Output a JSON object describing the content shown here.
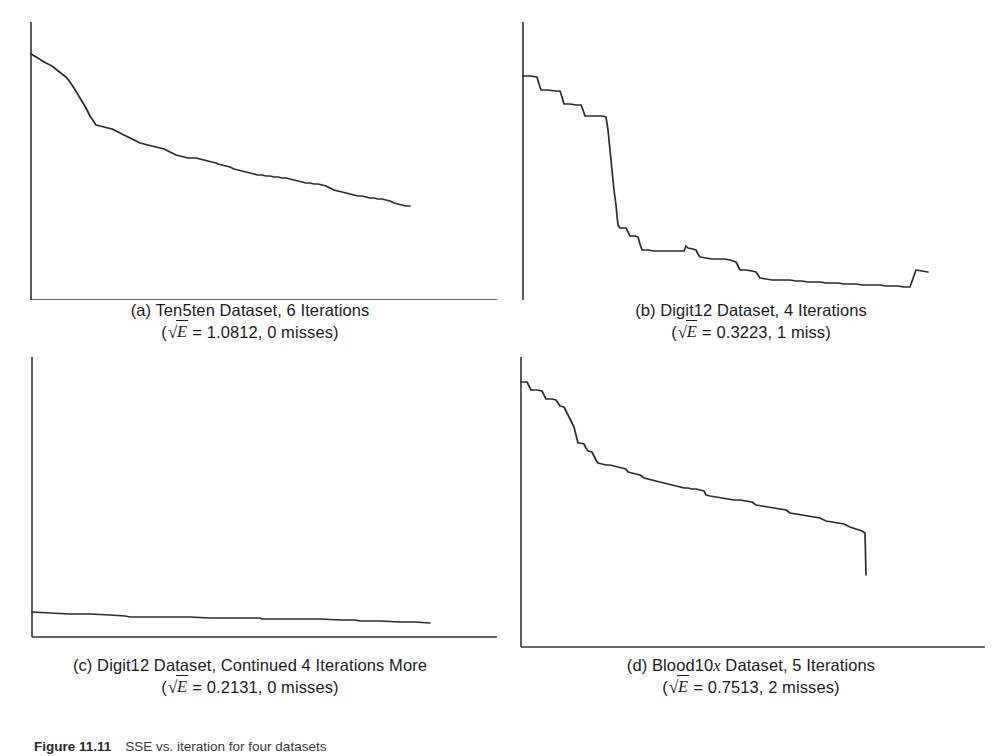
{
  "figure": {
    "label": "Figure 11.11",
    "caption_text": "SSE vs. iteration for four datasets",
    "panels": [
      {
        "id": "a",
        "position": "top-left",
        "caption_line_1": "(a) Ten5ten Dataset, 6 Iterations",
        "marker": "(a)",
        "dataset": "Ten5ten Dataset",
        "iterations_text": "6 Iterations",
        "metric_symbol": "E",
        "metric_value": "1.0812",
        "misses_text": "0 misses",
        "caption_line_2_prefix": "(",
        "caption_line_2_middle": " = 1.0812, 0 misses)"
      },
      {
        "id": "b",
        "position": "top-right",
        "caption_line_1": "(b) Digit12 Dataset, 4 Iterations",
        "marker": "(b)",
        "dataset": "Digit12 Dataset",
        "iterations_text": "4 Iterations",
        "metric_symbol": "E",
        "metric_value": "0.3223",
        "misses_text": "1 miss",
        "caption_line_2_prefix": "(",
        "caption_line_2_middle": " = 0.3223, 1 miss)"
      },
      {
        "id": "c",
        "position": "bottom-left",
        "caption_line_1": "(c) Digit12 Dataset, Continued 4 Iterations More",
        "marker": "(c)",
        "dataset": "Digit12 Dataset",
        "iterations_text": "Continued 4 Iterations More",
        "metric_symbol": "E",
        "metric_value": "0.2131",
        "misses_text": "0 misses",
        "caption_line_2_prefix": "(",
        "caption_line_2_middle": " = 0.2131, 0 misses)"
      },
      {
        "id": "d",
        "position": "bottom-right",
        "caption_line_1_pre": "(d) Blood10",
        "caption_line_1_italic": "x",
        "caption_line_1_post": " Dataset, 5 Iterations",
        "marker": "(d)",
        "dataset": "Blood10x Dataset",
        "iterations_text": "5 Iterations",
        "metric_symbol": "E",
        "metric_value": "0.7513",
        "misses_text": "2 misses",
        "caption_line_2_prefix": "(",
        "caption_line_2_middle": " = 0.7513, 2 misses)"
      }
    ]
  },
  "style": {
    "line_color": "#2b2b2b",
    "axis_color": "#333333",
    "background": "#ffffff",
    "text_color": "#1b1b1b"
  },
  "chart_data": [
    {
      "type": "line",
      "panel": "a",
      "title": "(a) Ten5ten Dataset, 6 Iterations",
      "xlabel": "",
      "ylabel": "",
      "grid": false,
      "legend": "none",
      "axis_box": {
        "x0": 31,
        "y0": 300,
        "x1": 497,
        "y1": 22
      },
      "xlim": [
        0,
        1
      ],
      "ylim": [
        0,
        1
      ],
      "sqrt_E": 1.0812,
      "misses": 0,
      "points": [
        [
          31,
          54
        ],
        [
          36,
          57
        ],
        [
          41,
          60
        ],
        [
          46,
          63
        ],
        [
          52,
          66
        ],
        [
          57,
          70
        ],
        [
          62,
          74
        ],
        [
          66,
          77
        ],
        [
          70,
          82
        ],
        [
          74,
          88
        ],
        [
          77,
          93
        ],
        [
          80,
          98
        ],
        [
          83,
          103
        ],
        [
          86,
          108
        ],
        [
          88,
          112
        ],
        [
          90,
          116
        ],
        [
          92,
          119
        ],
        [
          94,
          122
        ],
        [
          96,
          125
        ],
        [
          100,
          126
        ],
        [
          104,
          127
        ],
        [
          108,
          128
        ],
        [
          112,
          129
        ],
        [
          116,
          131
        ],
        [
          120,
          133
        ],
        [
          124,
          135
        ],
        [
          128,
          137
        ],
        [
          132,
          139
        ],
        [
          136,
          141
        ],
        [
          140,
          143
        ],
        [
          144,
          144
        ],
        [
          148,
          145
        ],
        [
          152,
          146
        ],
        [
          156,
          147
        ],
        [
          160,
          148
        ],
        [
          164,
          149
        ],
        [
          168,
          151
        ],
        [
          172,
          153
        ],
        [
          176,
          155
        ],
        [
          180,
          156
        ],
        [
          184,
          157
        ],
        [
          188,
          158
        ],
        [
          192,
          158
        ],
        [
          196,
          158
        ],
        [
          200,
          159
        ],
        [
          204,
          160
        ],
        [
          208,
          161
        ],
        [
          212,
          162
        ],
        [
          216,
          163
        ],
        [
          218,
          164
        ],
        [
          222,
          165
        ],
        [
          226,
          166
        ],
        [
          230,
          167
        ],
        [
          234,
          169
        ],
        [
          238,
          170
        ],
        [
          242,
          171
        ],
        [
          246,
          172
        ],
        [
          250,
          173
        ],
        [
          254,
          174
        ],
        [
          258,
          175
        ],
        [
          262,
          175
        ],
        [
          266,
          176
        ],
        [
          270,
          176
        ],
        [
          274,
          177
        ],
        [
          278,
          177
        ],
        [
          282,
          178
        ],
        [
          286,
          178
        ],
        [
          290,
          179
        ],
        [
          294,
          180
        ],
        [
          298,
          181
        ],
        [
          302,
          182
        ],
        [
          306,
          183
        ],
        [
          310,
          183
        ],
        [
          314,
          184
        ],
        [
          318,
          184
        ],
        [
          322,
          185
        ],
        [
          326,
          186
        ],
        [
          330,
          188
        ],
        [
          334,
          190
        ],
        [
          338,
          191
        ],
        [
          342,
          192
        ],
        [
          346,
          193
        ],
        [
          350,
          194
        ],
        [
          354,
          195
        ],
        [
          358,
          196
        ],
        [
          362,
          196
        ],
        [
          366,
          197
        ],
        [
          370,
          198
        ],
        [
          374,
          198
        ],
        [
          378,
          199
        ],
        [
          382,
          199
        ],
        [
          386,
          200
        ],
        [
          390,
          201
        ],
        [
          394,
          203
        ],
        [
          398,
          204
        ],
        [
          402,
          205
        ],
        [
          406,
          206
        ],
        [
          410,
          206
        ]
      ]
    },
    {
      "type": "line",
      "panel": "b",
      "title": "(b) Digit12 Dataset, 4 Iterations",
      "xlabel": "",
      "ylabel": "",
      "grid": false,
      "legend": "none",
      "axis_box": {
        "x0": 523,
        "y0": 305,
        "x1": 995,
        "y1": 22
      },
      "xlim": [
        0,
        1
      ],
      "ylim": [
        0,
        1
      ],
      "sqrt_E": 0.3223,
      "misses": 1,
      "points": [
        [
          523,
          76
        ],
        [
          530,
          76
        ],
        [
          537,
          77
        ],
        [
          539,
          84
        ],
        [
          541,
          90
        ],
        [
          548,
          90
        ],
        [
          555,
          91
        ],
        [
          560,
          91
        ],
        [
          562,
          97
        ],
        [
          564,
          104
        ],
        [
          570,
          104
        ],
        [
          576,
          105
        ],
        [
          581,
          105
        ],
        [
          583,
          110
        ],
        [
          585,
          116
        ],
        [
          590,
          116
        ],
        [
          596,
          116
        ],
        [
          602,
          116
        ],
        [
          606,
          117
        ],
        [
          608,
          130
        ],
        [
          610,
          150
        ],
        [
          612,
          170
        ],
        [
          614,
          190
        ],
        [
          616,
          205
        ],
        [
          617,
          216
        ],
        [
          618,
          225
        ],
        [
          620,
          228
        ],
        [
          626,
          228
        ],
        [
          628,
          232
        ],
        [
          630,
          236
        ],
        [
          635,
          236
        ],
        [
          638,
          237
        ],
        [
          640,
          244
        ],
        [
          642,
          250
        ],
        [
          648,
          250
        ],
        [
          654,
          251
        ],
        [
          660,
          251
        ],
        [
          666,
          251
        ],
        [
          672,
          251
        ],
        [
          678,
          251
        ],
        [
          684,
          251
        ],
        [
          686,
          246
        ],
        [
          688,
          248
        ],
        [
          693,
          249
        ],
        [
          696,
          250
        ],
        [
          698,
          254
        ],
        [
          700,
          257
        ],
        [
          706,
          258
        ],
        [
          712,
          259
        ],
        [
          718,
          259
        ],
        [
          724,
          259
        ],
        [
          730,
          260
        ],
        [
          736,
          262
        ],
        [
          738,
          266
        ],
        [
          740,
          270
        ],
        [
          746,
          270
        ],
        [
          752,
          271
        ],
        [
          756,
          272
        ],
        [
          758,
          275
        ],
        [
          760,
          278
        ],
        [
          766,
          279
        ],
        [
          772,
          280
        ],
        [
          778,
          280
        ],
        [
          784,
          280
        ],
        [
          790,
          280
        ],
        [
          796,
          281
        ],
        [
          802,
          281
        ],
        [
          808,
          282
        ],
        [
          814,
          282
        ],
        [
          820,
          282
        ],
        [
          826,
          283
        ],
        [
          832,
          283
        ],
        [
          838,
          283
        ],
        [
          844,
          284
        ],
        [
          850,
          284
        ],
        [
          856,
          284
        ],
        [
          862,
          285
        ],
        [
          868,
          285
        ],
        [
          874,
          285
        ],
        [
          880,
          285
        ],
        [
          886,
          286
        ],
        [
          892,
          286
        ],
        [
          898,
          286
        ],
        [
          904,
          287
        ],
        [
          910,
          287
        ],
        [
          916,
          270
        ],
        [
          922,
          271
        ],
        [
          928,
          272
        ]
      ]
    },
    {
      "type": "line",
      "panel": "c",
      "title": "(c) Digit12 Dataset, Continued 4 Iterations More",
      "xlabel": "",
      "ylabel": "",
      "grid": false,
      "legend": "none",
      "axis_box": {
        "x0": 32,
        "y0": 662,
        "x1": 497,
        "y1": 382
      },
      "xlim": [
        0,
        1
      ],
      "ylim": [
        0,
        1
      ],
      "sqrt_E": 0.2131,
      "misses": 0,
      "points": [
        [
          32,
          637
        ],
        [
          50,
          638
        ],
        [
          70,
          639
        ],
        [
          90,
          639
        ],
        [
          110,
          640
        ],
        [
          125,
          641
        ],
        [
          130,
          642
        ],
        [
          150,
          642
        ],
        [
          170,
          642
        ],
        [
          190,
          642
        ],
        [
          210,
          643
        ],
        [
          230,
          643
        ],
        [
          250,
          643
        ],
        [
          260,
          643
        ],
        [
          262,
          644
        ],
        [
          280,
          644
        ],
        [
          300,
          644
        ],
        [
          320,
          644
        ],
        [
          340,
          645
        ],
        [
          355,
          645
        ],
        [
          360,
          646
        ],
        [
          380,
          646
        ],
        [
          400,
          647
        ],
        [
          415,
          647
        ],
        [
          430,
          648
        ]
      ]
    },
    {
      "type": "line",
      "panel": "d",
      "title": "(d) Blood10x Dataset, 5 Iterations",
      "xlabel": "",
      "ylabel": "",
      "grid": false,
      "legend": "none",
      "axis_box": {
        "x0": 521,
        "y0": 672,
        "x1": 995,
        "y1": 382
      },
      "xlim": [
        0,
        1
      ],
      "ylim": [
        0,
        1
      ],
      "sqrt_E": 0.7513,
      "misses": 2,
      "points": [
        [
          521,
          407
        ],
        [
          527,
          407
        ],
        [
          529,
          411
        ],
        [
          531,
          415
        ],
        [
          537,
          415
        ],
        [
          542,
          416
        ],
        [
          544,
          420
        ],
        [
          546,
          424
        ],
        [
          552,
          424
        ],
        [
          556,
          425
        ],
        [
          558,
          428
        ],
        [
          560,
          431
        ],
        [
          564,
          432
        ],
        [
          566,
          436
        ],
        [
          568,
          440
        ],
        [
          570,
          444
        ],
        [
          572,
          448
        ],
        [
          574,
          452
        ],
        [
          575,
          456
        ],
        [
          576,
          460
        ],
        [
          577,
          464
        ],
        [
          578,
          468
        ],
        [
          580,
          468
        ],
        [
          584,
          469
        ],
        [
          586,
          473
        ],
        [
          588,
          476
        ],
        [
          592,
          477
        ],
        [
          594,
          481
        ],
        [
          596,
          485
        ],
        [
          598,
          488
        ],
        [
          602,
          489
        ],
        [
          606,
          490
        ],
        [
          610,
          490
        ],
        [
          614,
          491
        ],
        [
          618,
          492
        ],
        [
          622,
          493
        ],
        [
          626,
          494
        ],
        [
          628,
          497
        ],
        [
          632,
          498
        ],
        [
          636,
          499
        ],
        [
          640,
          500
        ],
        [
          644,
          503
        ],
        [
          648,
          504
        ],
        [
          652,
          505
        ],
        [
          656,
          506
        ],
        [
          660,
          507
        ],
        [
          664,
          508
        ],
        [
          668,
          509
        ],
        [
          672,
          510
        ],
        [
          676,
          511
        ],
        [
          680,
          512
        ],
        [
          684,
          513
        ],
        [
          688,
          513
        ],
        [
          692,
          514
        ],
        [
          696,
          514
        ],
        [
          700,
          515
        ],
        [
          704,
          516
        ],
        [
          706,
          520
        ],
        [
          710,
          521
        ],
        [
          716,
          522
        ],
        [
          722,
          523
        ],
        [
          728,
          524
        ],
        [
          734,
          525
        ],
        [
          740,
          525
        ],
        [
          746,
          526
        ],
        [
          752,
          527
        ],
        [
          756,
          530
        ],
        [
          762,
          531
        ],
        [
          768,
          532
        ],
        [
          774,
          533
        ],
        [
          780,
          534
        ],
        [
          786,
          535
        ],
        [
          790,
          538
        ],
        [
          796,
          539
        ],
        [
          802,
          540
        ],
        [
          808,
          541
        ],
        [
          814,
          542
        ],
        [
          820,
          543
        ],
        [
          826,
          546
        ],
        [
          832,
          547
        ],
        [
          838,
          548
        ],
        [
          844,
          549
        ],
        [
          850,
          552
        ],
        [
          856,
          554
        ],
        [
          862,
          556
        ],
        [
          865,
          558
        ],
        [
          866,
          600
        ]
      ]
    }
  ]
}
